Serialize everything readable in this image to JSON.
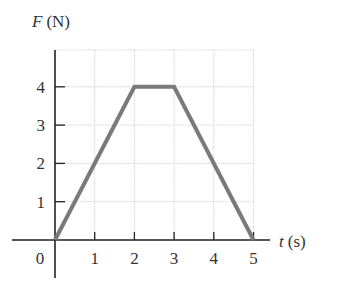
{
  "chart_data": {
    "type": "line",
    "title": "",
    "xlabel": "t (s)",
    "ylabel": "F (N)",
    "xlabel_var": "t",
    "xlabel_unit": "(s)",
    "ylabel_var": "F",
    "ylabel_unit": "(N)",
    "x_ticks": [
      0,
      1,
      2,
      3,
      4,
      5
    ],
    "y_ticks": [
      1,
      2,
      3,
      4
    ],
    "xlim": [
      0,
      5
    ],
    "ylim": [
      0,
      4
    ],
    "grid": true,
    "legend": null,
    "series": [
      {
        "name": "F(t)",
        "x": [
          0,
          2,
          3,
          5
        ],
        "y": [
          0,
          4,
          4,
          0
        ],
        "color": "#7a7a7a"
      }
    ]
  }
}
